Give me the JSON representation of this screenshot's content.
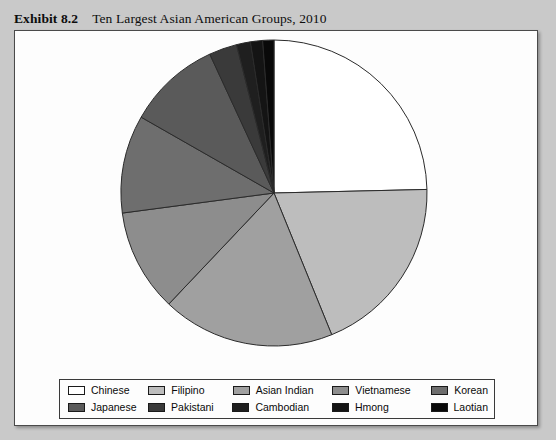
{
  "caption": {
    "exhibit_label": "Exhibit 8.2",
    "title": "Ten Largest Asian American Groups, 2010"
  },
  "colors": {
    "panel_background": "#fdfdfd",
    "page_background": "#c9c9c9",
    "slice_outline": "#2b2b2b",
    "legend_border": "#3a3a3a"
  },
  "chart_data": {
    "type": "pie",
    "title": "Ten Largest Asian American Groups, 2010",
    "start_angle_deg": 0,
    "direction": "clockwise",
    "legend_position": "bottom",
    "grid": false,
    "categories": [
      "Chinese",
      "Filipino",
      "Asian Indian",
      "Vietnamese",
      "Korean",
      "Japanese",
      "Pakistani",
      "Cambodian",
      "Hmong",
      "Laotian"
    ],
    "values": [
      25.0,
      19.5,
      18.5,
      11.0,
      10.5,
      10.0,
      3.0,
      1.5,
      1.3,
      1.2
    ],
    "slice_colors": [
      "#ffffff",
      "#bdbdbd",
      "#a0a0a0",
      "#8d8d8d",
      "#6e6e6e",
      "#5a5a5a",
      "#3a3a3a",
      "#1f1f1f",
      "#141414",
      "#090909"
    ],
    "slices": [
      {
        "label": "Chinese",
        "value": 25.0,
        "angle_deg": 90.0,
        "color": "#ffffff"
      },
      {
        "label": "Filipino",
        "value": 19.5,
        "angle_deg": 70.2,
        "color": "#bdbdbd"
      },
      {
        "label": "Asian Indian",
        "value": 18.5,
        "angle_deg": 66.6,
        "color": "#a0a0a0"
      },
      {
        "label": "Vietnamese",
        "value": 11.0,
        "angle_deg": 39.6,
        "color": "#8d8d8d"
      },
      {
        "label": "Korean",
        "value": 10.5,
        "angle_deg": 37.8,
        "color": "#6e6e6e"
      },
      {
        "label": "Japanese",
        "value": 10.0,
        "angle_deg": 36.0,
        "color": "#5a5a5a"
      },
      {
        "label": "Pakistani",
        "value": 3.0,
        "angle_deg": 10.8,
        "color": "#3a3a3a"
      },
      {
        "label": "Cambodian",
        "value": 1.5,
        "angle_deg": 5.4,
        "color": "#1f1f1f"
      },
      {
        "label": "Hmong",
        "value": 1.3,
        "angle_deg": 4.7,
        "color": "#141414"
      },
      {
        "label": "Laotian",
        "value": 1.2,
        "angle_deg": 4.3,
        "color": "#090909"
      }
    ]
  },
  "legend": {
    "rows": [
      [
        {
          "label": "Chinese",
          "color": "#ffffff"
        },
        {
          "label": "Filipino",
          "color": "#bdbdbd"
        },
        {
          "label": "Asian Indian",
          "color": "#a0a0a0"
        },
        {
          "label": "Vietnamese",
          "color": "#8d8d8d"
        },
        {
          "label": "Korean",
          "color": "#6e6e6e"
        }
      ],
      [
        {
          "label": "Japanese",
          "color": "#5a5a5a"
        },
        {
          "label": "Pakistani",
          "color": "#3a3a3a"
        },
        {
          "label": "Cambodian",
          "color": "#1f1f1f"
        },
        {
          "label": "Hmong",
          "color": "#141414"
        },
        {
          "label": "Laotian",
          "color": "#090909"
        }
      ]
    ]
  }
}
